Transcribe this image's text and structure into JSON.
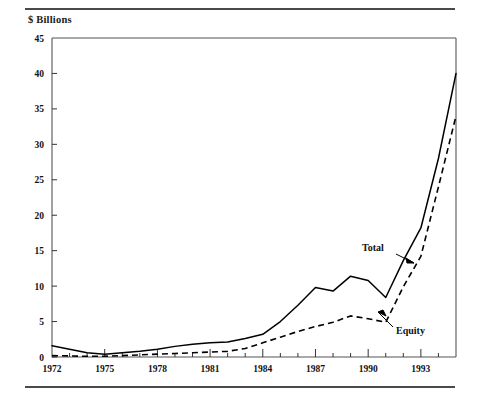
{
  "figure": {
    "y_axis_title": "$ Billions",
    "top_rule": "horizontal-rule",
    "bottom_rule": "horizontal-rule"
  },
  "chart_data": {
    "type": "line",
    "title": "",
    "subtitle": "",
    "xlabel": "",
    "ylabel": "$ Billions",
    "xlim": [
      1972,
      1995
    ],
    "ylim": [
      0,
      45
    ],
    "yticks": [
      0,
      5,
      10,
      15,
      20,
      25,
      30,
      35,
      40,
      45
    ],
    "ytick_labels": [
      "0",
      "5",
      "10",
      "15",
      "20",
      "25",
      "30",
      "35",
      "40",
      "45"
    ],
    "xticks": [
      1972,
      1973,
      1974,
      1975,
      1976,
      1977,
      1978,
      1979,
      1980,
      1981,
      1982,
      1983,
      1984,
      1985,
      1986,
      1987,
      1988,
      1989,
      1990,
      1991,
      1992,
      1993,
      1994,
      1995
    ],
    "xtick_labels_shown": [
      "1972",
      "1975",
      "1978",
      "1981",
      "1984",
      "1987",
      "1990",
      "1993"
    ],
    "xtick_labels_years": [
      1972,
      1975,
      1978,
      1981,
      1984,
      1987,
      1990,
      1993
    ],
    "grid": false,
    "legend_position": "inline-annotations",
    "x": [
      1972,
      1973,
      1974,
      1975,
      1976,
      1977,
      1978,
      1979,
      1980,
      1981,
      1982,
      1983,
      1984,
      1985,
      1986,
      1987,
      1988,
      1989,
      1990,
      1991,
      1992,
      1993,
      1994,
      1995
    ],
    "series": [
      {
        "name": "Total",
        "style": "solid",
        "color": "#000000",
        "values": [
          1.6,
          1.1,
          0.6,
          0.4,
          0.6,
          0.8,
          1.1,
          1.5,
          1.8,
          2.0,
          2.1,
          2.6,
          3.2,
          5.0,
          7.3,
          9.8,
          9.3,
          11.4,
          10.8,
          8.4,
          13.6,
          18.2,
          28.0,
          40.0
        ]
      },
      {
        "name": "Equity",
        "style": "dashed",
        "color": "#000000",
        "values": [
          0.2,
          0.15,
          0.1,
          0.1,
          0.2,
          0.3,
          0.4,
          0.5,
          0.6,
          0.7,
          0.8,
          1.2,
          2.0,
          2.8,
          3.6,
          4.3,
          4.9,
          5.8,
          5.4,
          4.9,
          9.9,
          14.2,
          24.0,
          34.0
        ]
      }
    ],
    "annotations": [
      {
        "text": "Total",
        "points_to_series": "Total",
        "points_to_year": 1992,
        "arrow_direction": "down-right"
      },
      {
        "text": "Equity",
        "points_to_series": "Equity",
        "points_to_year": 1991,
        "arrow_direction": "up-left"
      }
    ]
  }
}
